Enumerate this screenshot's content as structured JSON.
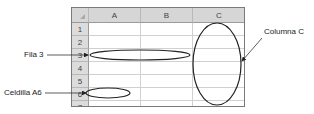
{
  "spreadsheet": {
    "columns": [
      "A",
      "B",
      "C"
    ],
    "rows": [
      "1",
      "2",
      "3",
      "4",
      "5",
      "6",
      "7"
    ]
  },
  "annotations": {
    "row_label": "Fila 3",
    "cell_label": "Celdilla A6",
    "column_label": "Columna C"
  }
}
